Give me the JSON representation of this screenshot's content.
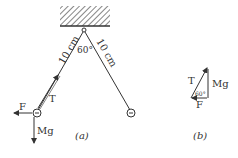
{
  "figure_a": {
    "caption": "(a)",
    "left_string_length": "10 cm",
    "right_string_length": "10 cm",
    "apex_angle": "60°",
    "force_labels": {
      "tension": "T",
      "horizontal_force": "F",
      "weight": "Mg"
    },
    "bob_charge_left": "−",
    "bob_charge_right": "−"
  },
  "figure_b": {
    "caption": "(b)",
    "labels": {
      "hypotenuse": "T",
      "vertical": "Mg",
      "horizontal": "F",
      "angle": "60°"
    }
  },
  "colors": {
    "line": "#333333",
    "background": "#ffffff"
  }
}
